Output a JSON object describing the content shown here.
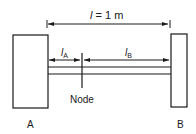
{
  "diagram": {
    "type": "mechanical-schematic",
    "colors": {
      "line": "#1a1a1a",
      "background": "#ffffff"
    },
    "total_length": {
      "symbol": "l",
      "equals": " = 1 m"
    },
    "segment_a": {
      "symbol": "l",
      "subscript": "A"
    },
    "segment_b": {
      "symbol": "l",
      "subscript": "B"
    },
    "node_label": "Node",
    "support_a_label": "A",
    "support_b_label": "B"
  }
}
